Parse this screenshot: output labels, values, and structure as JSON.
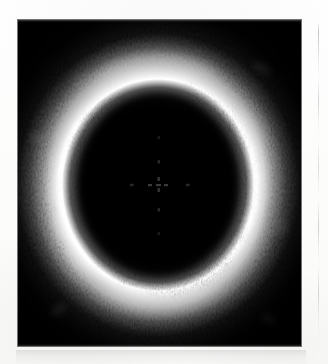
{
  "page": {
    "background_color": "#fdfdfc",
    "width": 328,
    "height": 364,
    "alt_text": ""
  },
  "figure": {
    "name": "ivus-cross-section",
    "modality": "intravascular ultrasound",
    "panel": {
      "x": 18,
      "y": 20,
      "width": 283,
      "height": 326,
      "background_color": "#040404"
    },
    "center_marker": {
      "x": 158,
      "y": 185,
      "label": ""
    },
    "lumen": {
      "center_x": 140,
      "center_y": 165,
      "radius_x": 86,
      "radius_y": 96
    },
    "vessel_wall": {
      "inner_radius": 88,
      "outer_radius": 138,
      "brightness": "high"
    }
  },
  "artifacts": {
    "column_rule": {
      "x": 318,
      "y": 22,
      "height": 330,
      "color": "#787878"
    },
    "caption_band": {
      "x": 16,
      "y": 350,
      "width": 290,
      "height": 14,
      "color": "#cdcdcd"
    }
  },
  "chart_data": {
    "type": "heatmap",
    "title": "",
    "xlabel": "",
    "ylabel": "",
    "colormap": "grayscale",
    "value_range": [
      0,
      255
    ],
    "legend": [],
    "grid": false,
    "speckles": [
      {
        "cx": 140,
        "cy": 34,
        "rx": 30,
        "ry": 13,
        "rot": -6,
        "i": 0.92
      },
      {
        "cx": 104,
        "cy": 42,
        "rx": 24,
        "ry": 11,
        "rot": -20,
        "i": 0.8
      },
      {
        "cx": 176,
        "cy": 44,
        "rx": 25,
        "ry": 11,
        "rot": 16,
        "i": 0.84
      },
      {
        "cx": 142,
        "cy": 56,
        "rx": 34,
        "ry": 13,
        "rot": 0,
        "i": 0.97
      },
      {
        "cx": 96,
        "cy": 62,
        "rx": 26,
        "ry": 12,
        "rot": -26,
        "i": 0.88
      },
      {
        "cx": 188,
        "cy": 62,
        "rx": 26,
        "ry": 12,
        "rot": 24,
        "i": 0.86
      },
      {
        "cx": 68,
        "cy": 80,
        "rx": 24,
        "ry": 12,
        "rot": -40,
        "i": 0.9
      },
      {
        "cx": 216,
        "cy": 84,
        "rx": 24,
        "ry": 12,
        "rot": 40,
        "i": 0.82
      },
      {
        "cx": 140,
        "cy": 74,
        "rx": 32,
        "ry": 12,
        "rot": 2,
        "i": 0.93
      },
      {
        "cx": 50,
        "cy": 106,
        "rx": 22,
        "ry": 12,
        "rot": -58,
        "i": 0.94
      },
      {
        "cx": 234,
        "cy": 110,
        "rx": 22,
        "ry": 12,
        "rot": 58,
        "i": 0.8
      },
      {
        "cx": 42,
        "cy": 136,
        "rx": 20,
        "ry": 12,
        "rot": -74,
        "i": 0.9
      },
      {
        "cx": 240,
        "cy": 142,
        "rx": 20,
        "ry": 12,
        "rot": 74,
        "i": 0.78
      },
      {
        "cx": 40,
        "cy": 168,
        "rx": 19,
        "ry": 12,
        "rot": -86,
        "i": 0.86
      },
      {
        "cx": 242,
        "cy": 172,
        "rx": 19,
        "ry": 12,
        "rot": 86,
        "i": 0.8
      },
      {
        "cx": 46,
        "cy": 202,
        "rx": 20,
        "ry": 12,
        "rot": -96,
        "i": 0.92
      },
      {
        "cx": 238,
        "cy": 204,
        "rx": 20,
        "ry": 12,
        "rot": 96,
        "i": 0.83
      },
      {
        "cx": 62,
        "cy": 234,
        "rx": 22,
        "ry": 12,
        "rot": -118,
        "i": 0.95
      },
      {
        "cx": 226,
        "cy": 236,
        "rx": 22,
        "ry": 12,
        "rot": 118,
        "i": 0.86
      },
      {
        "cx": 86,
        "cy": 262,
        "rx": 24,
        "ry": 12,
        "rot": -140,
        "i": 0.96
      },
      {
        "cx": 206,
        "cy": 264,
        "rx": 24,
        "ry": 12,
        "rot": 140,
        "i": 0.88
      },
      {
        "cx": 118,
        "cy": 280,
        "rx": 26,
        "ry": 12,
        "rot": -160,
        "i": 0.97
      },
      {
        "cx": 176,
        "cy": 282,
        "rx": 26,
        "ry": 12,
        "rot": 160,
        "i": 0.9
      },
      {
        "cx": 146,
        "cy": 288,
        "rx": 28,
        "ry": 12,
        "rot": 178,
        "i": 0.93
      }
    ]
  }
}
